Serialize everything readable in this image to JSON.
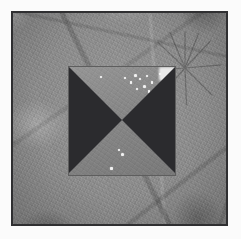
{
  "figure": {
    "kind": "grayscale-micrograph",
    "caption": "",
    "width_px": 241,
    "height_px": 239
  },
  "canvas": {
    "margin_color": "#fbfbfb",
    "margin_px": 11
  },
  "frame": {
    "label": "image-frame",
    "border_color": "#2f2f31",
    "border_width_px": 2,
    "x": 11,
    "y": 11,
    "width": 217,
    "height": 215
  },
  "background": {
    "label": "mottled-grayscale-texture",
    "base_color": "#8d8d8d",
    "light_tone": "#b4b4b4",
    "dark_tone": "#5a5a5a",
    "description": "mottled grainy grayscale surface with grain-boundary lineations and a radiating crack cluster"
  },
  "roi": {
    "label": "region-of-interest-square",
    "x": 68,
    "y": 66,
    "width": 108,
    "height": 110,
    "fill_color": "#878787",
    "outline_color": "#5e5e5e"
  },
  "bowtie": {
    "label": "bowtie-overlay",
    "dark_color": "#2b2b2e",
    "triangles": [
      {
        "name": "left-triangle",
        "points": "0,0 0,100 50,50"
      },
      {
        "name": "right-triangle",
        "points": "100,0 100,100 50,50"
      }
    ],
    "center": {
      "x_pct": 50,
      "y_pct": 50
    }
  },
  "specks": [
    {
      "name": "speck-1",
      "x_pct": 61,
      "y_pct": 7,
      "d": 3.2
    },
    {
      "name": "speck-2",
      "x_pct": 66,
      "y_pct": 11,
      "d": 2.0
    },
    {
      "name": "speck-3",
      "x_pct": 72,
      "y_pct": 8,
      "d": 2.6
    },
    {
      "name": "speck-4",
      "x_pct": 57,
      "y_pct": 14,
      "d": 2.2
    },
    {
      "name": "speck-5",
      "x_pct": 69,
      "y_pct": 17,
      "d": 3.0
    },
    {
      "name": "speck-6",
      "x_pct": 77,
      "y_pct": 14,
      "d": 2.2
    },
    {
      "name": "speck-7",
      "x_pct": 63,
      "y_pct": 20,
      "d": 1.8
    },
    {
      "name": "speck-8",
      "x_pct": 74,
      "y_pct": 22,
      "d": 2.4
    },
    {
      "name": "speck-9",
      "x_pct": 52,
      "y_pct": 10,
      "d": 1.8
    },
    {
      "name": "speck-10",
      "x_pct": 84,
      "y_pct": 6,
      "d": 2.4
    },
    {
      "name": "speck-11",
      "x_pct": 46,
      "y_pct": 75,
      "d": 2.0
    },
    {
      "name": "speck-12",
      "x_pct": 49,
      "y_pct": 79,
      "d": 3.0
    },
    {
      "name": "speck-13",
      "x_pct": 39,
      "y_pct": 92,
      "d": 2.6
    },
    {
      "name": "speck-14",
      "x_pct": 17,
      "y_pct": 33,
      "d": 1.8
    },
    {
      "name": "speck-15",
      "x_pct": 30,
      "y_pct": 9,
      "d": 2.0
    }
  ],
  "highlight_patch": {
    "label": "bright-corner-highlight",
    "x_pct": 84,
    "y_pct": 1,
    "w_pct": 16,
    "h_pct": 13,
    "color": "#e9e9e9"
  }
}
